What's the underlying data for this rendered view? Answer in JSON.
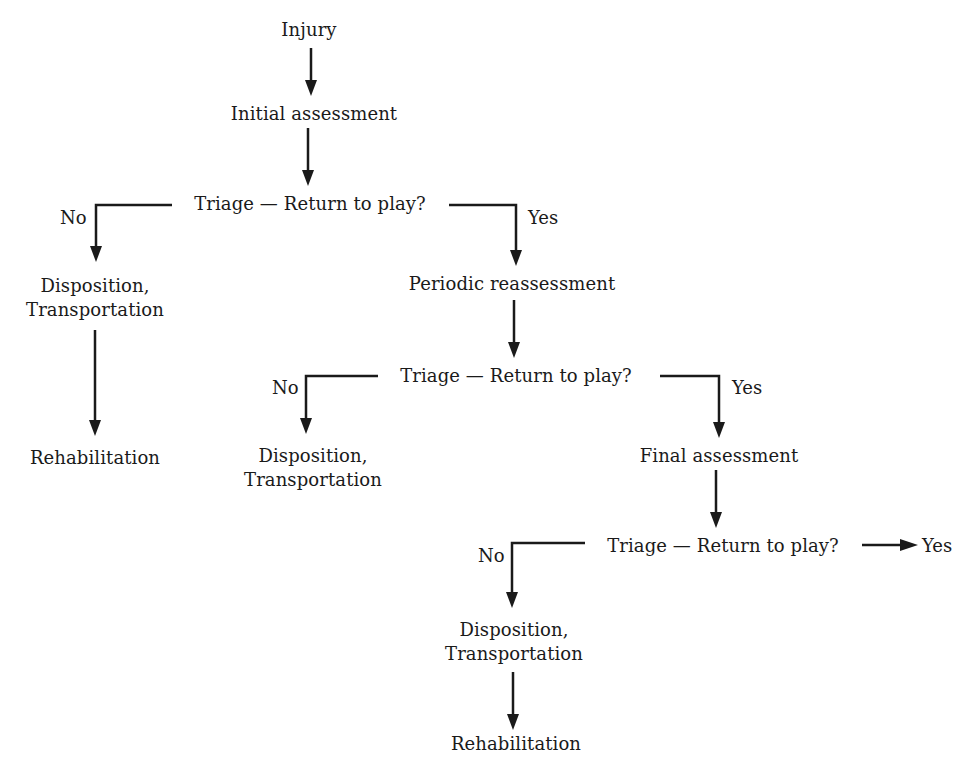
{
  "diagram": {
    "nodes": {
      "injury": "Injury",
      "initial_assessment": "Initial assessment",
      "triage1": "Triage — Return to play?",
      "disposition1_line1": "Disposition,",
      "disposition1_line2": "Transportation",
      "rehab1": "Rehabilitation",
      "periodic_reassessment": "Periodic reassessment",
      "triage2": "Triage — Return to play?",
      "disposition2_line1": "Disposition,",
      "disposition2_line2": "Transportation",
      "final_assessment": "Final assessment",
      "triage3": "Triage — Return to play?",
      "disposition3_line1": "Disposition,",
      "disposition3_line2": "Transportation",
      "rehab3": "Rehabilitation"
    },
    "edge_labels": {
      "no1": "No",
      "yes1": "Yes",
      "no2": "No",
      "yes2": "Yes",
      "no3": "No",
      "yes3": "Yes"
    },
    "colors": {
      "ink": "#1a1a1a",
      "background": "#ffffff"
    }
  }
}
